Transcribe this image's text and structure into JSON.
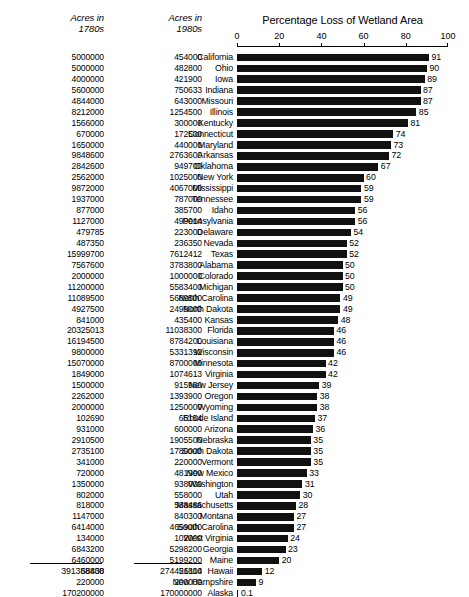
{
  "figure": {
    "columns": {
      "acres_1780s_header": "Acres in\n1780s",
      "acres_1980s_header": "Acres in\n1980s"
    },
    "totals": {
      "acres_1780s": "391388438",
      "acres_1980s": "274426114"
    },
    "caption": ""
  },
  "chart_data": {
    "type": "bar",
    "orientation": "horizontal",
    "title": "Percentage Loss of Wetland Area",
    "xlabel": "",
    "ylabel": "",
    "xlim": [
      0,
      100
    ],
    "xticks": [
      0,
      20,
      40,
      60,
      80,
      100
    ],
    "xtick_labels": [
      "0",
      "20",
      "40",
      "60",
      "80",
      "100"
    ],
    "grid": false,
    "legend": false,
    "bar_color": "#111111",
    "categories": [
      "California",
      "Ohio",
      "Iowa",
      "Indiana",
      "Missouri",
      "Illinois",
      "Kentucky",
      "Connecticut",
      "Maryland",
      "Arkansas",
      "Oklahoma",
      "New York",
      "Mississippi",
      "Tennessee",
      "Idaho",
      "Pennsylvania",
      "Delaware",
      "Nevada",
      "Texas",
      "Alabama",
      "Colorado",
      "Michigan",
      "North Carolina",
      "North Dakota",
      "Kansas",
      "Florida",
      "Louisiana",
      "Wisconsin",
      "Minnesota",
      "Virginia",
      "New Jersey",
      "Oregon",
      "Wyoming",
      "Rhode Island",
      "Arizona",
      "Nebraska",
      "South Dakota",
      "Vermont",
      "New Mexico",
      "Washington",
      "Utah",
      "Massachusetts",
      "Montana",
      "South Carolina",
      "West Virginia",
      "Georgia",
      "Maine",
      "Hawaii",
      "New Hampshire",
      "Alaska"
    ],
    "values": [
      91,
      90,
      89,
      87,
      87,
      85,
      81,
      74,
      73,
      72,
      67,
      60,
      59,
      59,
      56,
      56,
      54,
      52,
      52,
      50,
      50,
      50,
      49,
      49,
      48,
      46,
      46,
      46,
      42,
      42,
      39,
      38,
      38,
      37,
      36,
      35,
      35,
      35,
      33,
      31,
      30,
      28,
      27,
      27,
      24,
      23,
      20,
      12,
      9,
      0.1
    ],
    "value_labels": [
      "91",
      "90",
      "89",
      "87",
      "87",
      "85",
      "81",
      "74",
      "73",
      "72",
      "67",
      "60",
      "59",
      "59",
      "56",
      "56",
      "54",
      "52",
      "52",
      "50",
      "50",
      "50",
      "49",
      "49",
      "48",
      "46",
      "46",
      "46",
      "42",
      "42",
      "39",
      "38",
      "38",
      "37",
      "36",
      "35",
      "35",
      "35",
      "33",
      "31",
      "30",
      "28",
      "27",
      "27",
      "24",
      "23",
      "20",
      "12",
      "9",
      "0.1"
    ],
    "acres_1780s": [
      "5000000",
      "5000000",
      "4000000",
      "5600000",
      "4844000",
      "8212000",
      "1566000",
      "670000",
      "1650000",
      "9848600",
      "2842600",
      "2562000",
      "9872000",
      "1937000",
      "877000",
      "1127000",
      "479785",
      "487350",
      "15999700",
      "7567600",
      "2000000",
      "11200000",
      "11089500",
      "4927500",
      "841000",
      "20325013",
      "16194500",
      "9800000",
      "15070000",
      "1849000",
      "1500000",
      "2262000",
      "2000000",
      "102690",
      "931000",
      "2910500",
      "2735100",
      "341000",
      "720000",
      "1350000",
      "802000",
      "818000",
      "1147000",
      "6414000",
      "134000",
      "6843200",
      "6460000",
      "58800",
      "220000",
      "170200000"
    ],
    "acres_1980s": [
      "454000",
      "482800",
      "421900",
      "750633",
      "643000",
      "1254500",
      "300000",
      "172500",
      "440000",
      "2763600",
      "949700",
      "1025000",
      "4067000",
      "787000",
      "385700",
      "499014",
      "223000",
      "236350",
      "7612412",
      "3783800",
      "1000000",
      "5583400",
      "5689500",
      "2499000",
      "435400",
      "11038300",
      "8784200",
      "5331392",
      "8700000",
      "1074613",
      "915960",
      "1393900",
      "1250000",
      "65154",
      "600000",
      "1905500",
      "1780000",
      "220000",
      "481900",
      "938000",
      "558000",
      "588486",
      "840300",
      "4659000",
      "102000",
      "5298200",
      "5199200",
      "51800",
      "200000",
      "170000000"
    ]
  }
}
